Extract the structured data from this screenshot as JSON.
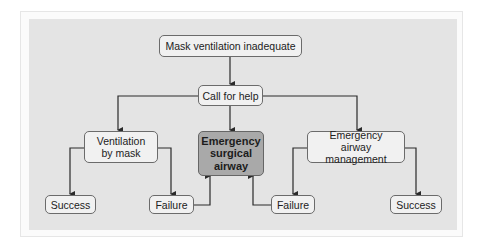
{
  "diagram": {
    "nodes": {
      "start": "Mask ventilation inadequate",
      "help": "Call for help",
      "mask": "Ventilation by mask",
      "surgical": "Emergency surgical airway",
      "emergency": "Emergency airway management",
      "success_left": "Success",
      "failure_left": "Failure",
      "failure_right": "Failure",
      "success_right": "Success"
    },
    "edges": [
      {
        "from": "start",
        "to": "help"
      },
      {
        "from": "help",
        "to": "mask"
      },
      {
        "from": "help",
        "to": "surgical"
      },
      {
        "from": "help",
        "to": "emergency"
      },
      {
        "from": "mask",
        "to": "success_left"
      },
      {
        "from": "mask",
        "to": "failure_left"
      },
      {
        "from": "failure_left",
        "to": "surgical"
      },
      {
        "from": "emergency",
        "to": "failure_right"
      },
      {
        "from": "emergency",
        "to": "success_right"
      },
      {
        "from": "failure_right",
        "to": "surgical"
      }
    ],
    "colors": {
      "panel": "#e4e4e4",
      "node": "#f1f1f1",
      "emphasis_node": "#a9a9a9",
      "line": "#2a2a2a"
    }
  }
}
